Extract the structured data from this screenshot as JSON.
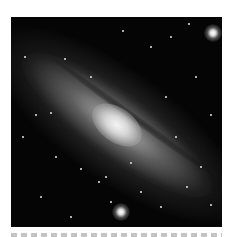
{
  "figure": {
    "colors": {
      "background": "#050505",
      "core": "#f4f4f4",
      "page": "#ffffff"
    },
    "bright_stars": [
      {
        "name": "bottom-star",
        "x": 110,
        "y": 195,
        "size": 9
      },
      {
        "name": "top-right-star",
        "x": 202,
        "y": 16,
        "size": 9
      }
    ],
    "faint_stars": [
      [
        54,
        42
      ],
      [
        112,
        14
      ],
      [
        178,
        7
      ],
      [
        40,
        96
      ],
      [
        25,
        98
      ],
      [
        155,
        80
      ],
      [
        200,
        98
      ],
      [
        12,
        120
      ],
      [
        95,
        160
      ],
      [
        120,
        146
      ],
      [
        88,
        165
      ],
      [
        70,
        152
      ],
      [
        176,
        170
      ],
      [
        190,
        150
      ],
      [
        30,
        180
      ],
      [
        60,
        200
      ],
      [
        150,
        190
      ],
      [
        200,
        188
      ],
      [
        14,
        40
      ],
      [
        80,
        60
      ],
      [
        140,
        30
      ],
      [
        160,
        20
      ],
      [
        185,
        60
      ],
      [
        45,
        140
      ],
      [
        130,
        175
      ],
      [
        100,
        185
      ],
      [
        165,
        120
      ]
    ]
  },
  "caption": {
    "text": "",
    "note": "caption line clipped at bottom edge; only top of glyphs visible"
  }
}
